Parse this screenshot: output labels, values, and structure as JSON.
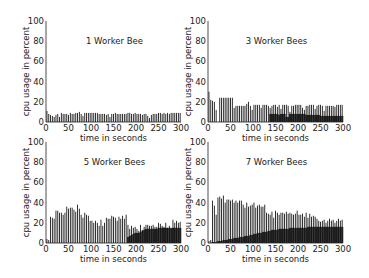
{
  "chart_data": [
    {
      "type": "bar",
      "title": "1 Worker Bee",
      "xlabel": "time in seconds",
      "ylabel": "cpu usage in percent",
      "xlim": [
        0,
        300
      ],
      "ylim": [
        0,
        100
      ],
      "xticks": [
        0,
        50,
        100,
        150,
        200,
        250,
        300
      ],
      "yticks": [
        0,
        20,
        40,
        60,
        80,
        100
      ],
      "grid": false,
      "series": [
        {
          "name": "cpu",
          "x_step": 4,
          "values": [
            11,
            8,
            7,
            6,
            5,
            7,
            8,
            5,
            9,
            8,
            8,
            8,
            7,
            9,
            8,
            8,
            9,
            9,
            10,
            8,
            6,
            9,
            9,
            9,
            9,
            9,
            9,
            9,
            9,
            8,
            8,
            8,
            8,
            7,
            8,
            5,
            8,
            8,
            9,
            8,
            8,
            8,
            8,
            8,
            8,
            9,
            9,
            8,
            8,
            9,
            8,
            8,
            8,
            7,
            8,
            8,
            6,
            4,
            7,
            8,
            8,
            8,
            9,
            9,
            8,
            9,
            8,
            9,
            8,
            9,
            9,
            9,
            9,
            9,
            9
          ]
        }
      ]
    },
    {
      "type": "bar",
      "title": "3 Worker Bees",
      "xlabel": "time in seconds",
      "ylabel": "cpu usage in percent",
      "xlim": [
        0,
        300
      ],
      "ylim": [
        0,
        100
      ],
      "xticks": [
        0,
        50,
        100,
        150,
        200,
        250,
        300
      ],
      "yticks": [
        0,
        20,
        40,
        60,
        80,
        100
      ],
      "grid": false,
      "series": [
        {
          "name": "cpu",
          "x_step": 4,
          "values": [
            30,
            22,
            21,
            20,
            12,
            0,
            24,
            24,
            24,
            24,
            24,
            24,
            24,
            24,
            14,
            16,
            16,
            16,
            16,
            16,
            16,
            18,
            20,
            16,
            12,
            17,
            17,
            17,
            17,
            14,
            17,
            17,
            17,
            16,
            14,
            16,
            17,
            17,
            15,
            17,
            13,
            17,
            17,
            17,
            16,
            10,
            16,
            16,
            17,
            17,
            17,
            17,
            14,
            12,
            16,
            16,
            17,
            17,
            17,
            13,
            16,
            17,
            17,
            16,
            11,
            16,
            16,
            16,
            16,
            16,
            15,
            17,
            17,
            17,
            17
          ]
        },
        {
          "name": "background",
          "x_step": 4,
          "values": [
            0,
            0,
            0,
            0,
            0,
            0,
            0,
            0,
            0,
            0,
            0,
            0,
            0,
            0,
            0,
            0,
            0,
            0,
            0,
            0,
            0,
            0,
            0,
            0,
            0,
            0,
            0,
            0,
            0,
            0,
            0,
            0,
            0,
            0,
            8,
            8,
            8,
            8,
            8,
            7,
            8,
            8,
            8,
            5,
            5,
            8,
            8,
            8,
            8,
            8,
            8,
            8,
            8,
            8,
            7,
            7,
            7,
            7,
            7,
            7,
            7,
            7,
            6,
            6,
            6,
            6,
            6,
            6,
            6,
            6,
            6,
            6,
            6,
            6,
            6
          ]
        }
      ]
    },
    {
      "type": "bar",
      "title": "5 Worker Bees",
      "xlabel": "time in seconds",
      "ylabel": "cpu usage in percent",
      "xlim": [
        0,
        300
      ],
      "ylim": [
        0,
        100
      ],
      "xticks": [
        0,
        50,
        100,
        150,
        200,
        250,
        300
      ],
      "yticks": [
        0,
        20,
        40,
        60,
        80,
        100
      ],
      "grid": false,
      "series": [
        {
          "name": "cpu",
          "x_step": 4,
          "values": [
            4,
            3,
            26,
            25,
            24,
            32,
            32,
            30,
            30,
            28,
            30,
            36,
            34,
            35,
            35,
            33,
            31,
            38,
            34,
            28,
            25,
            30,
            28,
            27,
            22,
            22,
            20,
            22,
            20,
            17,
            23,
            17,
            20,
            25,
            24,
            24,
            27,
            26,
            25,
            22,
            26,
            24,
            27,
            24,
            28,
            18,
            14,
            17,
            15,
            16,
            14,
            12,
            18,
            13,
            16,
            18,
            18,
            17,
            17,
            18,
            16,
            16,
            20,
            19,
            17,
            16,
            20,
            15,
            17,
            14,
            23,
            20,
            22,
            20,
            21
          ]
        },
        {
          "name": "background",
          "x_step": 4,
          "values": [
            0,
            0,
            0,
            0,
            0,
            0,
            0,
            0,
            0,
            0,
            0,
            0,
            0,
            0,
            0,
            0,
            0,
            0,
            0,
            0,
            0,
            0,
            0,
            0,
            0,
            0,
            0,
            0,
            0,
            0,
            0,
            0,
            0,
            0,
            0,
            0,
            0,
            0,
            0,
            0,
            0,
            0,
            0,
            0,
            0,
            6,
            7,
            8,
            9,
            10,
            10,
            10,
            11,
            12,
            13,
            14,
            14,
            14,
            14,
            14,
            14,
            14,
            15,
            15,
            15,
            15,
            15,
            15,
            15,
            15,
            15,
            15,
            15,
            15,
            15
          ]
        }
      ]
    },
    {
      "type": "bar",
      "title": "7 Worker Bees",
      "xlabel": "time in seconds",
      "ylabel": "cpu usage in percent",
      "xlim": [
        0,
        300
      ],
      "ylim": [
        0,
        100
      ],
      "xticks": [
        0,
        50,
        100,
        150,
        200,
        250,
        300
      ],
      "yticks": [
        0,
        20,
        40,
        60,
        80,
        100
      ],
      "grid": false,
      "series": [
        {
          "name": "cpu",
          "x_step": 4,
          "values": [
            2,
            3,
            42,
            37,
            28,
            45,
            46,
            44,
            47,
            40,
            43,
            43,
            42,
            43,
            40,
            42,
            40,
            42,
            42,
            38,
            35,
            40,
            36,
            37,
            38,
            40,
            35,
            37,
            38,
            36,
            36,
            38,
            30,
            29,
            28,
            31,
            25,
            32,
            30,
            28,
            30,
            30,
            29,
            31,
            29,
            30,
            29,
            28,
            29,
            32,
            28,
            28,
            29,
            26,
            30,
            25,
            29,
            26,
            27,
            26,
            24,
            22,
            21,
            22,
            23,
            20,
            22,
            24,
            22,
            23,
            20,
            22,
            24,
            22,
            23
          ]
        },
        {
          "name": "background",
          "x_step": 4,
          "values": [
            0,
            0,
            1,
            1,
            1,
            2,
            2,
            2,
            3,
            3,
            3,
            4,
            4,
            4,
            5,
            5,
            5,
            6,
            6,
            6,
            7,
            7,
            7,
            8,
            8,
            9,
            9,
            10,
            10,
            10,
            11,
            11,
            11,
            12,
            12,
            13,
            13,
            13,
            13,
            14,
            14,
            14,
            14,
            14,
            14,
            15,
            15,
            15,
            15,
            15,
            15,
            15,
            15,
            15,
            15,
            16,
            16,
            16,
            16,
            16,
            16,
            16,
            16,
            16,
            16,
            16,
            16,
            16,
            16,
            16,
            16,
            16,
            16,
            16,
            16
          ]
        }
      ]
    }
  ]
}
